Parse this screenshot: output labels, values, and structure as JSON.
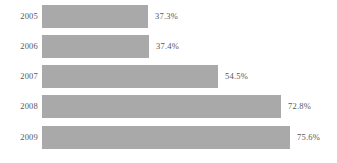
{
  "chart_data": {
    "type": "bar",
    "orientation": "horizontal",
    "title": "",
    "subtitle": "",
    "xlabel": "",
    "ylabel": "",
    "categories": [
      "2005",
      "2006",
      "2007",
      "2008",
      "2009"
    ],
    "values": [
      37.3,
      37.4,
      54.5,
      72.8,
      75.6
    ],
    "value_labels": [
      "37.3%",
      "37.4%",
      "54.5%",
      "72.8%",
      "75.6%"
    ],
    "series": [
      {
        "name": "",
        "values": [
          37.3,
          37.4,
          54.5,
          72.8,
          75.6
        ]
      }
    ],
    "unit": "%",
    "xlim": [
      0,
      75.6
    ],
    "ylim": null,
    "grid": false,
    "legend": false,
    "legend_position": "none",
    "axis_ticks": [],
    "annotations": []
  },
  "style": {
    "bar_color": "#a9a9a9",
    "text_color": "#57575a",
    "background": "#ffffff"
  },
  "rows": [
    {
      "category": "2005",
      "value": 37.3,
      "label": "37.3%",
      "bar_px": 106,
      "top_px": 5
    },
    {
      "category": "2006",
      "value": 37.4,
      "label": "37.4%",
      "bar_px": 107,
      "top_px": 35
    },
    {
      "category": "2007",
      "value": 54.5,
      "label": "54.5%",
      "bar_px": 176,
      "top_px": 65
    },
    {
      "category": "2008",
      "value": 72.8,
      "label": "72.8%",
      "bar_px": 239,
      "top_px": 95
    },
    {
      "category": "2009",
      "value": 75.6,
      "label": "75.6%",
      "bar_px": 248,
      "top_px": 126
    }
  ]
}
